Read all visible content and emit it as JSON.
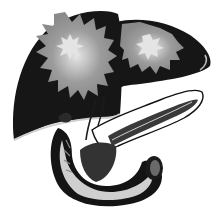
{
  "image": {
    "subject": "Illustration of liver, gallbladder, pancreas and duodenum",
    "style": "grayscale",
    "colors": {
      "background": "#ffffff",
      "dark_outline": "#1a1a1a",
      "mid_gray": "#9a9a9a",
      "light_highlight": "#dcdcdc",
      "pancreas_dark": "#3a3a3a"
    },
    "organs": [
      {
        "name": "liver-right-lobe"
      },
      {
        "name": "liver-left-lobe"
      },
      {
        "name": "gallbladder"
      },
      {
        "name": "pancreas"
      },
      {
        "name": "duodenum"
      }
    ]
  }
}
